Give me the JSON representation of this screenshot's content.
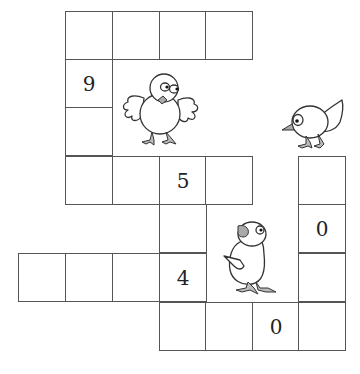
{
  "puzzle": {
    "cell_size": 47,
    "origin_x": 18,
    "origin_y": 11,
    "cells": [
      {
        "row": 0,
        "col": 1,
        "value": ""
      },
      {
        "row": 0,
        "col": 2,
        "value": ""
      },
      {
        "row": 0,
        "col": 3,
        "value": ""
      },
      {
        "row": 0,
        "col": 4,
        "value": ""
      },
      {
        "row": 1,
        "col": 1,
        "value": "9"
      },
      {
        "row": 2,
        "col": 1,
        "value": ""
      },
      {
        "row": 3,
        "col": 1,
        "value": ""
      },
      {
        "row": 3,
        "col": 2,
        "value": ""
      },
      {
        "row": 3,
        "col": 3,
        "value": "5"
      },
      {
        "row": 3,
        "col": 4,
        "value": ""
      },
      {
        "row": 3,
        "col": 6,
        "value": ""
      },
      {
        "row": 4,
        "col": 3,
        "value": ""
      },
      {
        "row": 4,
        "col": 6,
        "value": "0"
      },
      {
        "row": 5,
        "col": 0,
        "value": ""
      },
      {
        "row": 5,
        "col": 1,
        "value": ""
      },
      {
        "row": 5,
        "col": 2,
        "value": ""
      },
      {
        "row": 5,
        "col": 3,
        "value": "4"
      },
      {
        "row": 5,
        "col": 6,
        "value": ""
      },
      {
        "row": 6,
        "col": 3,
        "value": ""
      },
      {
        "row": 6,
        "col": 4,
        "value": ""
      },
      {
        "row": 6,
        "col": 5,
        "value": "0"
      },
      {
        "row": 6,
        "col": 6,
        "value": ""
      }
    ]
  },
  "illustrations": [
    {
      "name": "chick-front-wings-spread"
    },
    {
      "name": "bird-pecking"
    },
    {
      "name": "chick-looking-up"
    }
  ],
  "colors": {
    "grid_line": "#555555",
    "beak": "#aaaaaa",
    "outline": "#333333"
  }
}
